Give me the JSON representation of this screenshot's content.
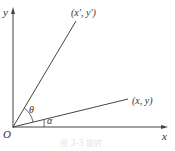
{
  "diagram": {
    "type": "coordinate-rotation",
    "axes": {
      "x_label": "x",
      "y_label": "y",
      "origin_label": "O"
    },
    "points": {
      "original": "(x, y)",
      "rotated": "(x′, y′)"
    },
    "angles": {
      "rotation": "θ",
      "initial": "α"
    },
    "caption": "图 3-3  旋转"
  },
  "colors": {
    "line": "#333333",
    "background": "#ffffff",
    "caption": "#e6e6e6"
  }
}
